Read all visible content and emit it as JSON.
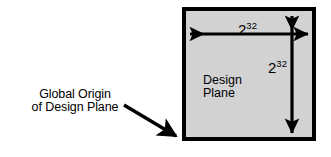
{
  "figure": {
    "type": "technical-diagram",
    "background_color": "#ffffff",
    "line_color": "#000000"
  },
  "design_plane": {
    "label_line1": "Design",
    "label_line2": "Plane",
    "fill_color": "#d2d2d2",
    "border_color": "#000000",
    "border_width_px": 4,
    "bounds": {
      "x": 182,
      "y": 7,
      "width": 134,
      "height": 134
    }
  },
  "dimensions": {
    "horizontal": {
      "base": "2",
      "exponent": "32",
      "value": "2^32",
      "orientation": "horizontal",
      "arrow": {
        "x1": 186,
        "y1": 34,
        "x2": 312,
        "y2": 34
      }
    },
    "vertical": {
      "base": "2",
      "exponent": "32",
      "value": "2^32",
      "orientation": "vertical",
      "arrow": {
        "x1": 292,
        "y1": 11,
        "x2": 292,
        "y2": 138
      }
    }
  },
  "callout": {
    "label_line1": "Global Origin",
    "label_line2": "of Design Plane",
    "pointer": {
      "x1": 123,
      "y1": 105,
      "x2": 181,
      "y2": 139
    },
    "target": "bottom-left corner of design plane"
  }
}
